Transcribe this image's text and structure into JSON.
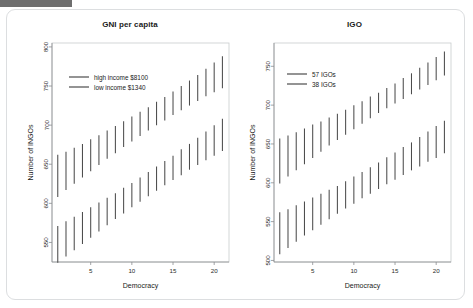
{
  "figure": {
    "background": "#ffffff",
    "card_border": "#dcdee0",
    "accent_bar_color": "#6e6e6e",
    "line_color": "#4c4c4c"
  },
  "chart_data": [
    {
      "type": "line",
      "panel_id": "gni-per-capita",
      "title": "GNI per capita",
      "xlabel": "Democracy",
      "ylabel": "Number of INGOs",
      "xlim": [
        0.3,
        21.8
      ],
      "ylim": [
        525,
        805
      ],
      "xticks": [
        5,
        10,
        15,
        20
      ],
      "yticks": [
        550,
        600,
        650,
        700,
        750,
        800
      ],
      "grid": false,
      "legend_position": "top-left",
      "marker_style": "vertical-confidence-bars",
      "x": [
        1,
        2,
        3,
        4,
        5,
        6,
        7,
        8,
        9,
        10,
        11,
        12,
        13,
        14,
        15,
        16,
        17,
        18,
        19,
        20,
        21
      ],
      "series": [
        {
          "name": "high income $8100",
          "values": [
            635,
            641,
            648,
            655,
            661,
            668,
            675,
            681,
            688,
            695,
            701,
            708,
            715,
            721,
            728,
            735,
            741,
            748,
            755,
            761,
            768
          ],
          "ci_lower": [
            608,
            617,
            625,
            633,
            641,
            649,
            657,
            664,
            672,
            679,
            686,
            693,
            700,
            706,
            713,
            719,
            725,
            731,
            737,
            742,
            747
          ],
          "ci_upper": [
            662,
            666,
            671,
            676,
            682,
            687,
            693,
            699,
            705,
            711,
            717,
            723,
            730,
            736,
            743,
            750,
            757,
            764,
            772,
            780,
            788
          ]
        },
        {
          "name": "low income $1340",
          "values": [
            548,
            555,
            562,
            569,
            576,
            583,
            590,
            597,
            604,
            611,
            618,
            625,
            632,
            639,
            646,
            653,
            660,
            667,
            674,
            681,
            688
          ],
          "ci_lower": [
            524,
            532,
            540,
            548,
            556,
            564,
            572,
            580,
            587,
            595,
            602,
            609,
            616,
            623,
            630,
            636,
            643,
            649,
            655,
            661,
            667
          ],
          "ci_upper": [
            571,
            577,
            583,
            589,
            595,
            601,
            607,
            613,
            620,
            626,
            633,
            640,
            647,
            654,
            661,
            669,
            676,
            684,
            692,
            700,
            708
          ]
        }
      ]
    },
    {
      "type": "line",
      "panel_id": "igo",
      "title": "IGO",
      "xlabel": "Democracy",
      "ylabel": "Number of INGOs",
      "xlim": [
        0.3,
        21.8
      ],
      "ylim": [
        498,
        780
      ],
      "xticks": [
        5,
        10,
        15,
        20
      ],
      "yticks": [
        500,
        550,
        600,
        650,
        700,
        750
      ],
      "grid": false,
      "legend_position": "top-left",
      "marker_style": "vertical-confidence-bars",
      "x": [
        1,
        2,
        3,
        4,
        5,
        6,
        7,
        8,
        9,
        10,
        11,
        12,
        13,
        14,
        15,
        16,
        17,
        18,
        19,
        20,
        21
      ],
      "series": [
        {
          "name": "57 IGOs",
          "values": [
            628,
            634,
            640,
            647,
            653,
            659,
            665,
            671,
            678,
            684,
            690,
            696,
            702,
            709,
            715,
            721,
            727,
            733,
            740,
            746,
            752
          ],
          "ci_lower": [
            599,
            608,
            616,
            624,
            632,
            640,
            648,
            655,
            662,
            669,
            676,
            683,
            690,
            696,
            702,
            708,
            714,
            720,
            726,
            732,
            738
          ],
          "ci_upper": [
            657,
            661,
            665,
            670,
            675,
            679,
            684,
            689,
            694,
            700,
            705,
            711,
            716,
            722,
            728,
            735,
            741,
            748,
            755,
            762,
            769
          ]
        },
        {
          "name": "38 IGOs",
          "values": [
            535,
            541,
            547,
            554,
            560,
            566,
            572,
            578,
            585,
            591,
            597,
            603,
            609,
            616,
            622,
            628,
            634,
            640,
            647,
            653,
            659
          ],
          "ci_lower": [
            508,
            516,
            524,
            532,
            539,
            546,
            553,
            560,
            567,
            573,
            580,
            586,
            592,
            598,
            604,
            610,
            616,
            621,
            627,
            632,
            638
          ],
          "ci_upper": [
            562,
            566,
            571,
            576,
            581,
            586,
            591,
            596,
            602,
            608,
            614,
            620,
            626,
            633,
            639,
            646,
            652,
            659,
            666,
            673,
            680
          ]
        }
      ]
    }
  ]
}
